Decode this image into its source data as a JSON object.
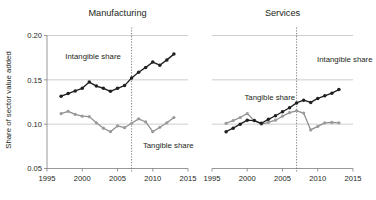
{
  "figure": {
    "width": 376,
    "height": 200,
    "background": "#ffffff",
    "y_axis_title": "Share of sector value added",
    "colors": {
      "intangible": "#231f20",
      "tangible": "#9a9a9d",
      "gridline": "#b9b9bb",
      "axis": "#7d7d80",
      "event_line": "#58585b"
    }
  },
  "chart_data": [
    {
      "type": "line",
      "title": "Manufacturing",
      "xlabel": "",
      "ylabel": "Share of sector value added",
      "xlim": [
        1995,
        2015
      ],
      "ylim": [
        0.05,
        0.2
      ],
      "xticks": [
        1995,
        2000,
        2005,
        2010,
        2015
      ],
      "xtick_labels": [
        "1995",
        "2000",
        "2005",
        "2010",
        "2015"
      ],
      "yticks": [
        0.05,
        0.1,
        0.15,
        0.2
      ],
      "ytick_labels": [
        "0.05",
        "0.10",
        "0.15",
        "0.20"
      ],
      "grid": true,
      "legend": "annotations-inline",
      "annotations": [
        {
          "text": "Intangible share",
          "x": 1997.6,
          "y": 0.1735
        },
        {
          "text": "Tangible share",
          "x": 2008.6,
          "y": 0.0735
        }
      ],
      "event_line": {
        "x": 2007,
        "style": "dotted"
      },
      "x": [
        1997,
        1998,
        1999,
        2000,
        2001,
        2002,
        2003,
        2004,
        2005,
        2006,
        2007,
        2008,
        2009,
        2010,
        2011,
        2012,
        2013
      ],
      "series": [
        {
          "name": "Intangible share",
          "color": "#231f20",
          "marker": "circle-filled",
          "values": [
            0.1315,
            0.1345,
            0.1375,
            0.1405,
            0.1475,
            0.143,
            0.1405,
            0.137,
            0.1405,
            0.1435,
            0.152,
            0.1585,
            0.164,
            0.17,
            0.1665,
            0.1725,
            0.179
          ]
        },
        {
          "name": "Tangible share",
          "color": "#9a9a9d",
          "marker": "circle-filled",
          "values": [
            0.112,
            0.1145,
            0.111,
            0.109,
            0.1085,
            0.1015,
            0.0955,
            0.0915,
            0.098,
            0.096,
            0.101,
            0.106,
            0.1025,
            0.0915,
            0.0965,
            0.1015,
            0.1075
          ]
        }
      ]
    },
    {
      "type": "line",
      "title": "Services",
      "xlabel": "",
      "ylabel": "",
      "xlim": [
        1995,
        2015
      ],
      "ylim": [
        0.05,
        0.2
      ],
      "xticks": [
        1995,
        2000,
        2005,
        2010,
        2015
      ],
      "xtick_labels": [
        "1995",
        "2000",
        "2005",
        "2010",
        "2015"
      ],
      "yticks": [
        0.05,
        0.1,
        0.15,
        0.2
      ],
      "ytick_labels": [
        "",
        "",
        "",
        ""
      ],
      "grid": true,
      "legend": "annotations-inline",
      "annotations": [
        {
          "text": "Tangible share",
          "x": 1999.6,
          "y": 0.1275
        },
        {
          "text": "Intangible share",
          "x": 2009.9,
          "y": 0.17
        }
      ],
      "event_line": {
        "x": 2007,
        "style": "dotted"
      },
      "x": [
        1997,
        1998,
        1999,
        2000,
        2001,
        2002,
        2003,
        2004,
        2005,
        2006,
        2007,
        2008,
        2009,
        2010,
        2011,
        2012,
        2013
      ],
      "series": [
        {
          "name": "Tangible share",
          "color": "#9a9a9d",
          "marker": "circle-filled",
          "values": [
            0.101,
            0.104,
            0.1075,
            0.112,
            0.104,
            0.1,
            0.102,
            0.1045,
            0.109,
            0.113,
            0.115,
            0.1125,
            0.0935,
            0.0975,
            0.1015,
            0.102,
            0.1015
          ]
        },
        {
          "name": "Intangible share",
          "color": "#231f20",
          "marker": "circle-filled",
          "values": [
            0.0915,
            0.0955,
            0.1,
            0.1045,
            0.104,
            0.101,
            0.1055,
            0.1095,
            0.114,
            0.1185,
            0.124,
            0.127,
            0.1245,
            0.129,
            0.132,
            0.135,
            0.139
          ]
        }
      ]
    }
  ]
}
